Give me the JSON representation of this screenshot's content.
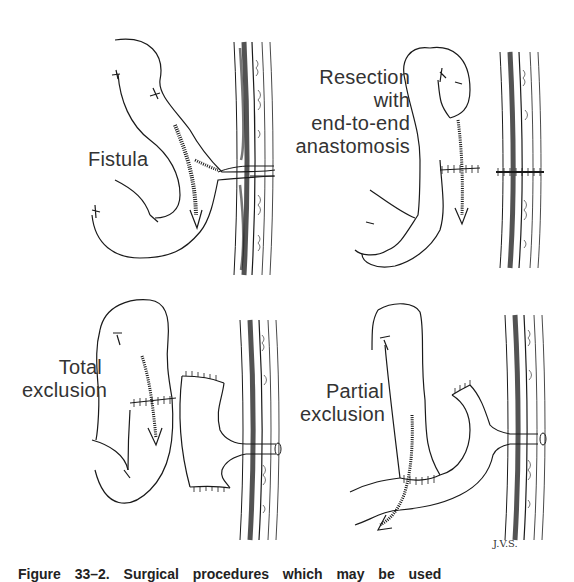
{
  "figure": {
    "caption": "Figure 33–2. Surgical procedures which may be used",
    "signature": "J.V.S.",
    "panels": [
      {
        "id": "fistula",
        "label_lines": [
          "Fistula"
        ]
      },
      {
        "id": "resection",
        "label_lines": [
          "Resection",
          "with",
          "end-to-end",
          "anastomosis"
        ]
      },
      {
        "id": "total-exclusion",
        "label_lines": [
          "Total",
          "exclusion"
        ]
      },
      {
        "id": "partial-exclusion",
        "label_lines": [
          "Partial",
          "exclusion"
        ]
      }
    ]
  },
  "colors": {
    "ink": "#1a1a1a",
    "text": "#333333",
    "background": "#ffffff"
  }
}
